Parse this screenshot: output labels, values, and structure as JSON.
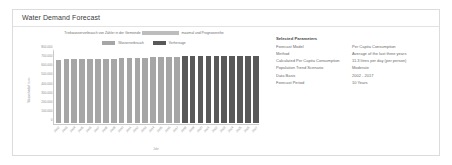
{
  "card": {
    "title": "Water Demand Forecast"
  },
  "parameters": {
    "heading": "Selected Parameters",
    "rows": [
      {
        "label": "Forecast Model",
        "value": "Per Capita Consumption"
      },
      {
        "label": "Method",
        "value": "Average of the last three years"
      },
      {
        "label": "Calculated Per Capita Consumption",
        "value": "11.3 litres per day (per person)"
      },
      {
        "label": "Population Trend Scenario",
        "value": "Moderate"
      },
      {
        "label": "Data Basis",
        "value": "2002 - 2017"
      },
      {
        "label": "Forecast Period",
        "value": "10 Years"
      }
    ]
  },
  "chart_data": {
    "type": "bar",
    "title_prefix": "Trinkwasserverbrauch von Zähler in der Gemeinde",
    "title_redacted": "████████",
    "title_suffix": "maximal und Prognosereihe",
    "xlabel": "Jahr",
    "ylabel": "Wasserbedarf in m³",
    "ylim": [
      0,
      800000
    ],
    "yticks": [
      0,
      100000,
      200000,
      300000,
      400000,
      500000,
      600000,
      700000,
      800000
    ],
    "ytick_labels": [
      "0",
      "100.000",
      "200.000",
      "300.000",
      "400.000",
      "500.000",
      "600.000",
      "700.000",
      "800.000"
    ],
    "grid": false,
    "legend_position": "top-center",
    "legend": [
      {
        "label": "Wasserverbrauch",
        "color": "#a6a6a6"
      },
      {
        "label": "Vorhersage",
        "color": "#595959"
      }
    ],
    "colors": {
      "historical": "#a6a6a6",
      "forecast": "#595959"
    },
    "categories": [
      "2002",
      "2003",
      "2004",
      "2005",
      "2006",
      "2007",
      "2008",
      "2009",
      "2010",
      "2011",
      "2012",
      "2013",
      "2014",
      "2015",
      "2016",
      "2017",
      "2018",
      "2019",
      "2020",
      "2021",
      "2022",
      "2023",
      "2024",
      "2025",
      "2026",
      "2027"
    ],
    "series": [
      {
        "name": "Wasserverbrauch",
        "values": [
          690000,
          705000,
          707000,
          702000,
          700000,
          705000,
          708000,
          710000,
          712000,
          713000,
          715000,
          718000,
          722000,
          725000,
          726000,
          727000,
          null,
          null,
          null,
          null,
          null,
          null,
          null,
          null,
          null,
          null
        ]
      },
      {
        "name": "Vorhersage",
        "values": [
          null,
          null,
          null,
          null,
          null,
          null,
          null,
          null,
          null,
          null,
          null,
          null,
          null,
          null,
          null,
          null,
          733000,
          734000,
          735000,
          736000,
          736000,
          737000,
          737000,
          738000,
          738000,
          739000
        ]
      }
    ]
  }
}
